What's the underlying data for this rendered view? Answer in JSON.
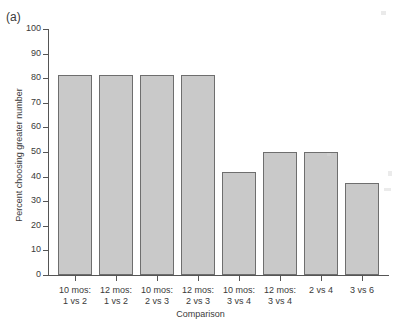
{
  "panel": {
    "label": "(a)"
  },
  "axes": {
    "ylabel": "Percent choosing greater number",
    "xlabel": "Comparison",
    "yticks": [
      "0",
      "10",
      "20",
      "30",
      "40",
      "50",
      "60",
      "70",
      "80",
      "90",
      "100"
    ]
  },
  "colors": {
    "bar_fill": "#c9c9c9",
    "bar_border": "#6e6e6e",
    "axis": "#555555",
    "text": "#3a3a3a",
    "background": "#ffffff"
  },
  "chart_data": {
    "type": "bar",
    "title": "(a)",
    "xlabel": "Comparison",
    "ylabel": "Percent choosing greater number",
    "ylim": [
      0,
      100
    ],
    "ytick_step": 10,
    "grid": false,
    "legend": null,
    "categories": [
      "10 mos:\n1 vs 2",
      "12 mos:\n1 vs 2",
      "10 mos:\n2 vs 3",
      "12 mos:\n2 vs 3",
      "10 mos:\n3 vs 4",
      "12 mos:\n3 vs 4",
      "2 vs 4",
      "3 vs 6"
    ],
    "category_lines": [
      [
        "10 mos:",
        "1 vs 2"
      ],
      [
        "12 mos:",
        "1 vs 2"
      ],
      [
        "10 mos:",
        "2 vs 3"
      ],
      [
        "12 mos:",
        "2 vs 3"
      ],
      [
        "10 mos:",
        "3 vs 4"
      ],
      [
        "12 mos:",
        "3 vs 4"
      ],
      [
        "2 vs 4",
        ""
      ],
      [
        "3 vs 6",
        ""
      ]
    ],
    "values": [
      81.3,
      81.3,
      81.3,
      81.3,
      41.7,
      49.8,
      49.8,
      37.4
    ]
  }
}
